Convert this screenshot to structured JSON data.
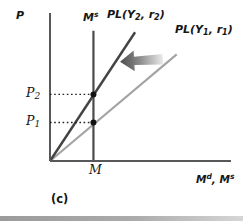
{
  "figure": {
    "panel_label": "(c)",
    "background_color": "#ffffff",
    "axis_color": "#58585a",
    "dotted_line_color": "#222222",
    "point_color": "#121212"
  },
  "labels": {
    "y_axis": "P",
    "ms": {
      "base": "M",
      "sup": "s"
    },
    "pl2": {
      "a": "PL(Y",
      "sub1": "2",
      "b": ", r",
      "sub2": "2",
      "c": ")"
    },
    "pl1": {
      "a": "PL(Y",
      "sub1": "1",
      "b": ", r",
      "sub2": "1",
      "c": ")"
    },
    "p2": {
      "base": "P",
      "sub": "2"
    },
    "p1": {
      "base": "P",
      "sub": "1"
    },
    "m_tick": "M",
    "x_axis": {
      "a": "M",
      "sup1": "d",
      "b": ", M",
      "sup2": "s"
    },
    "panel": "(c)"
  },
  "chart_data": {
    "type": "line",
    "title": "",
    "xlabel": "M^d, M^s",
    "ylabel": "P",
    "axis_units": "qualitative (index 0-100, no numeric scale shown)",
    "xlim": [
      0,
      100
    ],
    "ylim": [
      0,
      100
    ],
    "grid": false,
    "legend": "none (lines labeled inline)",
    "series": [
      {
        "id": "pl-y1-r1",
        "name": "PL(Y1, r1) money demand",
        "color": "#a6a4a2",
        "width": 2.2,
        "x": [
          0,
          70
        ],
        "y": [
          0,
          72
        ]
      },
      {
        "id": "pl-y2-r2",
        "name": "PL(Y2, r2) money demand",
        "color": "#454341",
        "width": 2.4,
        "x": [
          0,
          47
        ],
        "y": [
          0,
          87
        ]
      },
      {
        "id": "money-supply",
        "name": "M^s money supply (vertical at M)",
        "color": "#4a4a4a",
        "width": 2.2,
        "x": [
          24,
          24
        ],
        "y": [
          0,
          88
        ]
      }
    ],
    "reference_lines": [
      {
        "id": "p2-dotted-line",
        "label": "P2",
        "y": 45,
        "from_x": 0,
        "to_x": 24,
        "style": "dotted"
      },
      {
        "id": "p1-dotted-line",
        "label": "P1",
        "y": 26,
        "from_x": 0,
        "to_x": 24,
        "style": "dotted"
      }
    ],
    "points": [
      {
        "id": "equilibrium-point-2",
        "name": "equilibrium at P2",
        "x": 24,
        "y": 45
      },
      {
        "id": "equilibrium-point-1",
        "name": "equilibrium at P1",
        "x": 24,
        "y": 26
      }
    ],
    "x_ticks": [
      {
        "value": 24,
        "label": "M"
      }
    ],
    "y_ticks": [
      {
        "value": 45,
        "label": "P2"
      },
      {
        "value": 26,
        "label": "P1"
      }
    ],
    "annotations": [
      {
        "id": "shift-left-arrow",
        "type": "block-arrow",
        "direction": "left",
        "meaning": "leftward shift of money demand from PL(Y1, r1) to PL(Y2, r2)",
        "gradient": [
          "#4c4c4c",
          "#ebebeb"
        ]
      }
    ]
  }
}
